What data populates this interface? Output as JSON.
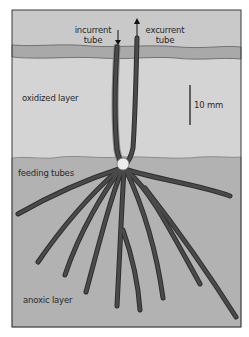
{
  "diagram": {
    "labels": {
      "incurrent": "incurrent tube",
      "incurrent_line1": "incurrent",
      "incurrent_line2": "tube",
      "excurrent_line1": "excurrent",
      "excurrent_line2": "tube",
      "oxidized": "oxidized layer",
      "feeding": "feeding tubes",
      "anoxic": "anoxic layer",
      "scale": "10 mm"
    },
    "colors": {
      "water": "#c9c9c9",
      "surface_band": "#a8a8a8",
      "oxidized_layer": "#d3d3d3",
      "anoxic_layer": "#b1b1b1",
      "tube": "#4a4a4a",
      "tube_outline": "#2e2e2e",
      "frame": "#3a3a3a",
      "animal": "#ececec"
    }
  }
}
